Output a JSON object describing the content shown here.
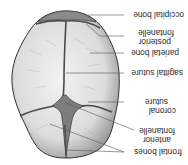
{
  "diagram": {
    "orientation": "rotated 180 degrees",
    "colors": {
      "bone_fill": "#e4e4e4",
      "bone_shade": "#9a9a9a",
      "suture": "#4a4a4a",
      "fontanelle": "#7d7d7d",
      "outline": "#333333",
      "leader_line": "#555555",
      "text": "#2a2a2a"
    },
    "labels": {
      "occipital_bone": "occipital bone",
      "posterior_fontanelle_1": "posterior",
      "posterior_fontanelle_2": "fontanelle",
      "parietal_bone": "parietal bone",
      "sagittal_suture": "sagittal suture",
      "coronal_suture_1": "coronal",
      "coronal_suture_2": "suture",
      "anterior_fontanelle_1": "anterior",
      "anterior_fontanelle_2": "fontanelle",
      "frontal_bones": "frontal bones"
    }
  }
}
